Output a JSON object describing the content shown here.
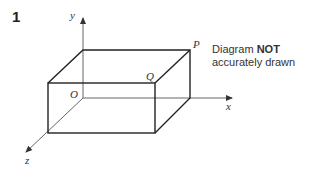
{
  "question": {
    "number": "1"
  },
  "note": {
    "prefix": "Diagram ",
    "emphasis": "NOT",
    "line2": "accurately drawn"
  },
  "labels": {
    "x_axis": "x",
    "y_axis": "y",
    "z_axis": "z",
    "origin": "O",
    "point_p": "P",
    "point_q": "Q"
  },
  "colors": {
    "line": "#222222",
    "axis": "#555555"
  }
}
